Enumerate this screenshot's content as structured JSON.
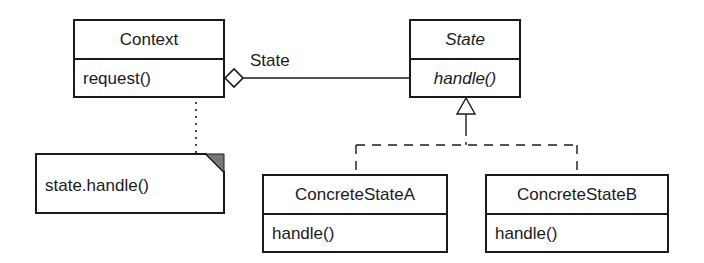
{
  "diagram": {
    "type": "UML class diagram",
    "pattern": "State",
    "classes": [
      {
        "id": "context",
        "name": "Context",
        "abstract": false,
        "operations": [
          "request()"
        ]
      },
      {
        "id": "state",
        "name": "State",
        "abstract": true,
        "operations": [
          "handle()"
        ]
      },
      {
        "id": "concrete_a",
        "name": "ConcreteStateA",
        "abstract": false,
        "operations": [
          "handle()"
        ]
      },
      {
        "id": "concrete_b",
        "name": "ConcreteStateB",
        "abstract": false,
        "operations": [
          "handle()"
        ]
      }
    ],
    "association": {
      "from": "Context",
      "to": "State",
      "kind": "aggregation",
      "label": "State"
    },
    "generalizations": [
      {
        "from": "ConcreteStateA",
        "to": "State",
        "style": "dashed"
      },
      {
        "from": "ConcreteStateB",
        "to": "State",
        "style": "dashed"
      }
    ],
    "note": {
      "text": "state.handle()",
      "attached_to": "Context.request()"
    },
    "colors": {
      "stroke": "#1a1a1a",
      "note_fold": "#777777",
      "background": "#ffffff"
    }
  }
}
